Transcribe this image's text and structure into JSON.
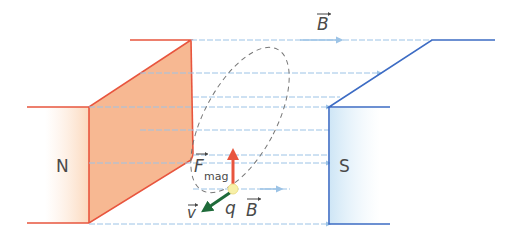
{
  "diagram": {
    "north_pole": {
      "label": "N",
      "color": "#e8553e",
      "fill": "#f7b892"
    },
    "south_pole": {
      "label": "S",
      "color": "#3d6cc4",
      "fill": "#d9ecf8"
    },
    "field": {
      "label": "B",
      "color": "#9cc3e6"
    },
    "force": {
      "label": "F",
      "subscript": "mag",
      "color": "#e8553e"
    },
    "velocity": {
      "label": "v",
      "color": "#1f6b3a"
    },
    "charge": {
      "label": "q",
      "color": "#f7f0a8"
    },
    "charge_field_label": "B",
    "orbit": {
      "style": "dashed",
      "color": "#777777"
    }
  }
}
